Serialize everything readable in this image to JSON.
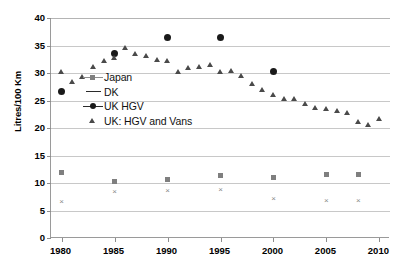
{
  "chart_data": {
    "type": "scatter",
    "title": "",
    "subtitle": "",
    "xlabel": "",
    "ylabel": "Litres/100 Km",
    "xlim": [
      1979,
      2011
    ],
    "ylim": [
      0,
      40
    ],
    "ytick_labels": [
      "0",
      "5",
      "10",
      "15",
      "20",
      "25",
      "30",
      "35",
      "40"
    ],
    "ytick_values": [
      0,
      5,
      10,
      15,
      20,
      25,
      30,
      35,
      40
    ],
    "xtick_labels": [
      "1980",
      "1985",
      "1990",
      "1995",
      "2000",
      "2005",
      "2010"
    ],
    "xtick_values": [
      1980,
      1985,
      1990,
      1995,
      2000,
      2005,
      2010
    ],
    "grid": "horizontal",
    "legend_position": "inside-upper-left",
    "series": [
      {
        "name": "Japan",
        "marker": "square",
        "color": "#7f7f7f",
        "points": [
          [
            1980,
            11.9
          ],
          [
            1985,
            10.2
          ],
          [
            1990,
            10.6
          ],
          [
            1995,
            11.3
          ],
          [
            2000,
            11.0
          ],
          [
            2005,
            11.6
          ],
          [
            2008,
            11.5
          ]
        ]
      },
      {
        "name": "DK",
        "marker": "x",
        "color": "#8a8a8a",
        "points": [
          [
            1980,
            6.6
          ],
          [
            1985,
            8.4
          ],
          [
            1990,
            8.6
          ],
          [
            1995,
            8.8
          ],
          [
            2000,
            7.1
          ],
          [
            2005,
            6.8
          ],
          [
            2008,
            6.8
          ]
        ]
      },
      {
        "name": "UK HGV",
        "marker": "circle",
        "color": "#1a1a1a",
        "points": [
          [
            1980,
            26.6
          ],
          [
            1985,
            33.5
          ],
          [
            1990,
            36.5
          ],
          [
            1995,
            36.4
          ],
          [
            2000,
            30.3
          ]
        ]
      },
      {
        "name": "UK: HGV and Vans",
        "marker": "triangle",
        "color": "#4a4a4a",
        "points": [
          [
            1980,
            30.1
          ],
          [
            1981,
            28.3
          ],
          [
            1982,
            29.2
          ],
          [
            1983,
            31.0
          ],
          [
            1984,
            32.1
          ],
          [
            1985,
            32.7
          ],
          [
            1986,
            34.5
          ],
          [
            1987,
            33.4
          ],
          [
            1988,
            33.1
          ],
          [
            1989,
            32.4
          ],
          [
            1990,
            32.2
          ],
          [
            1991,
            30.1
          ],
          [
            1992,
            30.8
          ],
          [
            1993,
            31.1
          ],
          [
            1994,
            31.4
          ],
          [
            1995,
            30.2
          ],
          [
            1996,
            30.4
          ],
          [
            1997,
            29.4
          ],
          [
            1998,
            27.9
          ],
          [
            1999,
            26.9
          ],
          [
            2000,
            26.0
          ],
          [
            2001,
            25.3
          ],
          [
            2002,
            25.2
          ],
          [
            2003,
            24.3
          ],
          [
            2004,
            23.6
          ],
          [
            2005,
            23.5
          ],
          [
            2006,
            23.1
          ],
          [
            2007,
            22.7
          ],
          [
            2008,
            21.1
          ],
          [
            2009,
            20.6
          ],
          [
            2010,
            21.6
          ]
        ]
      }
    ]
  },
  "legend": {
    "items": [
      {
        "label": "Japan",
        "marker": "line-square"
      },
      {
        "label": "DK",
        "marker": "line"
      },
      {
        "label": "UK HGV",
        "marker": "line-circle"
      },
      {
        "label": "UK: HGV and Vans",
        "marker": "triangle"
      }
    ]
  }
}
